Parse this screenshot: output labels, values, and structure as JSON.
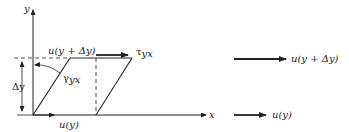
{
  "diagram": {
    "axes": {
      "y_label": "y",
      "x_label": "x"
    },
    "element_labels": {
      "top_velocity": "u(y + Δy)",
      "bottom_velocity": "u(y)",
      "shear_stress": "τyx",
      "shear_stress_base": "τ",
      "shear_stress_sub": "yx",
      "shear_angle": "γyx",
      "shear_angle_base": "γ",
      "shear_angle_sub": "yx",
      "height": "Δy"
    },
    "velocity_profile": {
      "top_label": "u(y + Δy)",
      "bottom_label": "u(y)"
    }
  }
}
